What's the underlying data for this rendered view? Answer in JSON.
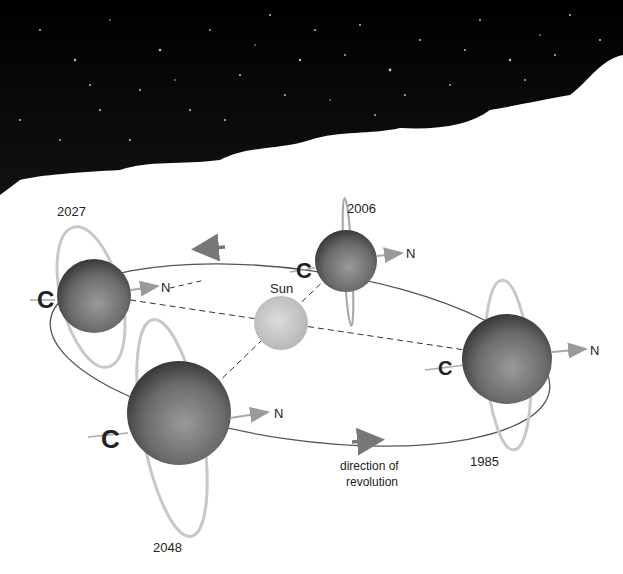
{
  "diagram": {
    "background": "starfield-photo-top",
    "sun": {
      "label": "Sun",
      "color": "#c8c8c8"
    },
    "planets": [
      {
        "year": "2027",
        "north_label": "N"
      },
      {
        "year": "2006",
        "north_label": "N"
      },
      {
        "year": "1985",
        "north_label": "N"
      },
      {
        "year": "2048",
        "north_label": "N"
      }
    ],
    "direction_label_line1": "direction of",
    "direction_label_line2": "revolution",
    "colors": {
      "planet_dark": "#3a3a3a",
      "planet_mid": "#7a7a7a",
      "ring": "#d8d8d8",
      "orbit": "#555555",
      "arrow": "#8a8a8a"
    }
  }
}
